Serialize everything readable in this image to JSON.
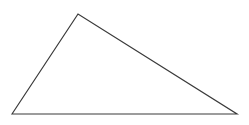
{
  "figure": {
    "kind": "line-drawing",
    "canvas": {
      "width": 249,
      "height": 125,
      "background_color": "#ffffff",
      "has_border": false
    },
    "shape": {
      "name": "triangle",
      "shape_type": "scalene-triangle",
      "fill": "none",
      "stroke_color": "#3a3a3a",
      "stroke_width": 1.2,
      "vertices": [
        {
          "label": "bottom-left",
          "x": 12,
          "y": 114
        },
        {
          "label": "apex",
          "x": 78,
          "y": 14
        },
        {
          "label": "bottom-right",
          "x": 237,
          "y": 114
        }
      ],
      "points_attr": "12,114 78,14 237,114",
      "edges": [
        {
          "label": "left-edge",
          "from": "bottom-left",
          "to": "apex"
        },
        {
          "label": "right-edge",
          "from": "apex",
          "to": "bottom-right"
        },
        {
          "label": "base-edge",
          "from": "bottom-right",
          "to": "bottom-left"
        }
      ]
    },
    "labels": [],
    "annotations": []
  }
}
